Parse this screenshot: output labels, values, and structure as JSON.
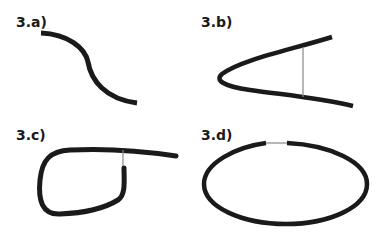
{
  "figure": {
    "background": "#ffffff",
    "stroke_color": "#1a1a1a",
    "connector_color": "#888888",
    "panels": [
      {
        "id": "3a",
        "label": "3.a)",
        "description": "S-shaped curve (open arc)"
      },
      {
        "id": "3b",
        "label": "3.b)",
        "description": "Parabola-like curve opening right with thin vertical connector between its arms"
      },
      {
        "id": "3c",
        "label": "3.c)",
        "description": "Loop curve with thin connector joining the inner end to the outgoing tail"
      },
      {
        "id": "3d",
        "label": "3.d)",
        "description": "Ellipse with small gap at top bridged by a thin line"
      }
    ]
  }
}
